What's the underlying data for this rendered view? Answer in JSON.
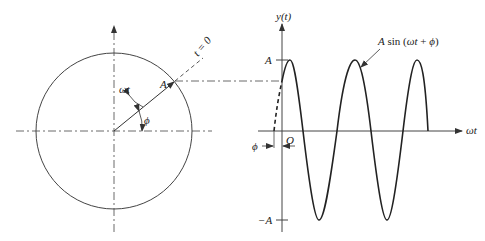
{
  "phasor": {
    "amplitude_label": "A",
    "angle_wt_label": "ωt",
    "phase_label": "ϕ",
    "reference_label": "t = 0"
  },
  "waveform": {
    "y_axis_label": "y(t)",
    "x_axis_label": "ωt",
    "origin_label": "O",
    "pos_amplitude_label": "A",
    "neg_amplitude_label": "−A",
    "phase_label": "ϕ",
    "curve_label": "A sin (ωt + ϕ)"
  },
  "colors": {
    "line": "#333333",
    "curve": "#222222",
    "background": "#ffffff"
  }
}
